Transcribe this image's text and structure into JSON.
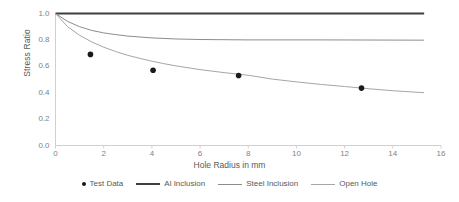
{
  "chart_data": {
    "type": "line",
    "title": "",
    "xlabel": "Hole Radius in mm",
    "ylabel": "Stress Ratio",
    "xlim": [
      0,
      16
    ],
    "ylim": [
      0,
      1.0
    ],
    "xticks": [
      "0",
      "2",
      "4",
      "6",
      "8",
      "10",
      "12",
      "14",
      "16"
    ],
    "yticks": [
      "0.0",
      "0.2",
      "0.4",
      "0.6",
      "0.8",
      "1.0"
    ],
    "grid": false,
    "legend_position": "bottom",
    "series": [
      {
        "name": "Test Data",
        "type": "scatter",
        "marker": "circle",
        "color": "#1a1a1a",
        "points": [
          {
            "x": 1.45,
            "y": 0.69
          },
          {
            "x": 4.05,
            "y": 0.57
          },
          {
            "x": 7.6,
            "y": 0.53
          },
          {
            "x": 12.7,
            "y": 0.435
          }
        ]
      },
      {
        "name": "Al Inclusion",
        "type": "line",
        "color": "#3f3f3f",
        "width": 2.2,
        "points": [
          {
            "x": 0.0,
            "y": 1.0
          },
          {
            "x": 15.3,
            "y": 1.0
          }
        ]
      },
      {
        "name": "Steel Inclusion",
        "type": "line",
        "color": "#8c8c8c",
        "width": 1.0,
        "points": [
          {
            "x": 0.0,
            "y": 1.0
          },
          {
            "x": 0.5,
            "y": 0.94
          },
          {
            "x": 1.0,
            "y": 0.9
          },
          {
            "x": 1.5,
            "y": 0.872
          },
          {
            "x": 2.0,
            "y": 0.853
          },
          {
            "x": 2.5,
            "y": 0.84
          },
          {
            "x": 3.0,
            "y": 0.829
          },
          {
            "x": 4.0,
            "y": 0.815
          },
          {
            "x": 5.0,
            "y": 0.807
          },
          {
            "x": 6.0,
            "y": 0.803
          },
          {
            "x": 8.0,
            "y": 0.8
          },
          {
            "x": 11.0,
            "y": 0.8
          },
          {
            "x": 15.3,
            "y": 0.798
          }
        ]
      },
      {
        "name": "Open Hole",
        "type": "line",
        "color": "#a6a6a6",
        "width": 1.0,
        "points": [
          {
            "x": 0.0,
            "y": 1.0
          },
          {
            "x": 0.5,
            "y": 0.9
          },
          {
            "x": 1.0,
            "y": 0.835
          },
          {
            "x": 1.5,
            "y": 0.785
          },
          {
            "x": 2.0,
            "y": 0.745
          },
          {
            "x": 2.5,
            "y": 0.712
          },
          {
            "x": 3.0,
            "y": 0.683
          },
          {
            "x": 3.5,
            "y": 0.66
          },
          {
            "x": 4.0,
            "y": 0.639
          },
          {
            "x": 4.5,
            "y": 0.62
          },
          {
            "x": 5.0,
            "y": 0.603
          },
          {
            "x": 6.0,
            "y": 0.575
          },
          {
            "x": 7.0,
            "y": 0.552
          },
          {
            "x": 8.0,
            "y": 0.532
          },
          {
            "x": 9.0,
            "y": 0.503
          },
          {
            "x": 10.0,
            "y": 0.482
          },
          {
            "x": 11.0,
            "y": 0.463
          },
          {
            "x": 12.0,
            "y": 0.447
          },
          {
            "x": 13.0,
            "y": 0.43
          },
          {
            "x": 14.0,
            "y": 0.415
          },
          {
            "x": 15.3,
            "y": 0.4
          }
        ]
      }
    ]
  },
  "axes": {
    "ylabel": "Stress Ratio",
    "xlabel": "Hole Radius in mm"
  },
  "legend": {
    "items": [
      {
        "label": "Test Data",
        "marker": "dot"
      },
      {
        "label": "Al Inclusion",
        "marker": "line-thick"
      },
      {
        "label": "Steel Inclusion",
        "marker": "line-thin"
      },
      {
        "label": "Open Hole",
        "marker": "line-thin"
      }
    ]
  },
  "style": {
    "axis_color": "#d0d0d0",
    "tick_color": "#7f7f7f",
    "marker_color": "#1a1a1a",
    "al_color": "#3f3f3f",
    "steel_color": "#8c8c8c",
    "open_color": "#a6a6a6",
    "background": "#ffffff"
  }
}
